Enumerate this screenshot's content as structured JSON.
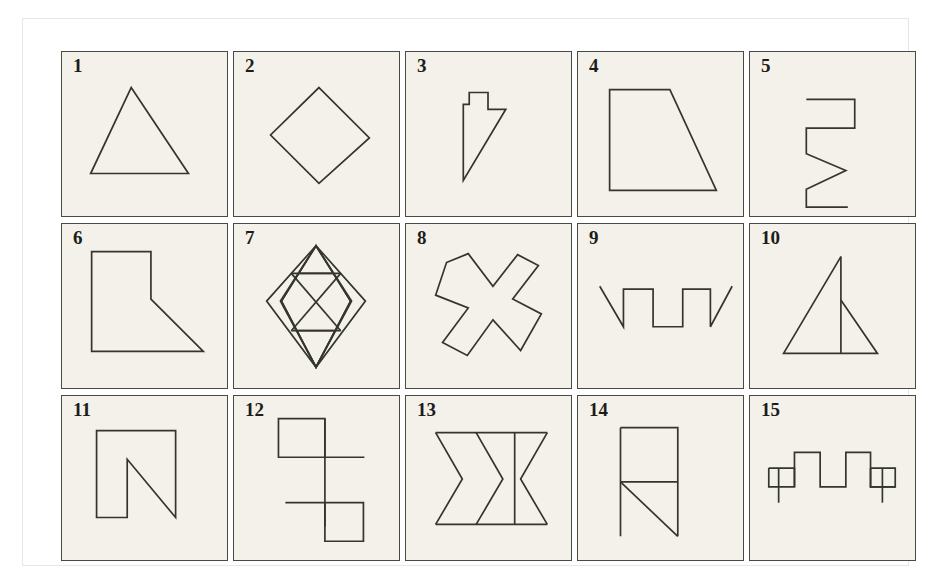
{
  "plate": {
    "background_color": "#ffffff",
    "cell_background_color": "#f3f1ea",
    "cell_border_color": "#4a4a45",
    "stroke_color": "#35352f",
    "label_color": "#1c1c1a",
    "rows": 3,
    "columns": 5,
    "total_figures": 15
  },
  "figures": [
    {
      "label": "1",
      "name": "triangle",
      "description": "isosceles triangle pointing up"
    },
    {
      "label": "2",
      "name": "diamond",
      "description": "square rotated 45 degrees"
    },
    {
      "label": "3",
      "name": "notched-arrow",
      "description": "narrow vertical strip with top tab and diagonal point"
    },
    {
      "label": "4",
      "name": "right-trapezoid",
      "description": "trapezoid with vertical left side and slanted right side"
    },
    {
      "label": "5",
      "name": "square-with-zigzag-tail",
      "description": "small square on top of a vertical line that becomes a zigzag"
    },
    {
      "label": "6",
      "name": "flag-polygon",
      "description": "rectangle with lower right corner cut by a long diagonal"
    },
    {
      "label": "7",
      "name": "subdivided-diamond",
      "description": "large diamond divided into four smaller diamonds"
    },
    {
      "label": "8",
      "name": "concave-cross",
      "description": "X shape with concave left and right notches"
    },
    {
      "label": "9",
      "name": "crenellated-line",
      "description": "square wave with two battlements and diagonal ends"
    },
    {
      "label": "10",
      "name": "triangle-with-median",
      "description": "triangle with a vertical line from apex to base"
    },
    {
      "label": "11",
      "name": "n-polygon",
      "description": "letter N shaped outline"
    },
    {
      "label": "12",
      "name": "offset-squares-with-bar",
      "description": "two squares joined by a vertical bar with horizontal stubs"
    },
    {
      "label": "13",
      "name": "chevron-band",
      "description": "horizontal band divided by zigzag chevrons"
    },
    {
      "label": "14",
      "name": "rectangle-with-diagonal",
      "description": "rectangle with a horizontal divider and a diagonal below"
    },
    {
      "label": "15",
      "name": "square-wave-with-end-squares",
      "description": "square wave flanked by small squares with stems"
    }
  ]
}
